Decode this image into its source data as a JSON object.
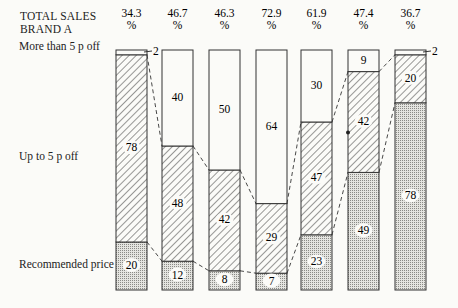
{
  "chart_data": {
    "type": "bar",
    "stacked": true,
    "percent_stacked": true,
    "title": "TOTAL SALES BRAND A",
    "title_lines": [
      "TOTAL SALES",
      "BRAND A"
    ],
    "categories": [
      "34.3 %",
      "46.7 %",
      "46.3 %",
      "72.9 %",
      "61.9 %",
      "47.4 %",
      "36.7 %"
    ],
    "totals": [
      34.3,
      46.7,
      46.3,
      72.9,
      61.9,
      47.4,
      36.7
    ],
    "total_unit": "%",
    "series": [
      {
        "name": "Recommended price",
        "pattern": "dotted",
        "values": [
          20,
          12,
          8,
          7,
          23,
          49,
          78
        ]
      },
      {
        "name": "Up to 5 p off",
        "pattern": "hatched",
        "values": [
          78,
          48,
          42,
          29,
          47,
          42,
          20
        ]
      },
      {
        "name": "More than 5 p off",
        "pattern": "blank",
        "values": [
          2,
          40,
          50,
          64,
          30,
          9,
          2
        ]
      }
    ],
    "row_labels": [
      "More than 5 p off",
      "Up to 5 p off",
      "Recommended price"
    ],
    "outside_labels": [
      {
        "bar": 0,
        "value": "2"
      },
      {
        "bar": 6,
        "value": "2"
      }
    ],
    "ylim": [
      0,
      100
    ],
    "grid": false,
    "legend": "row labels on left",
    "connectors": "dashed lines joining segment boundaries of adjacent bars"
  },
  "labels": {
    "title_line1": "TOTAL SALES",
    "title_line2": "BRAND A",
    "row_more": "More than 5 p off",
    "row_upto": "Up to 5 p off",
    "row_rec": "Recommended price"
  },
  "colors": {
    "ink": "#222222",
    "paper": "#fbfbf8",
    "dotted_fill": "#c9c9c6"
  }
}
